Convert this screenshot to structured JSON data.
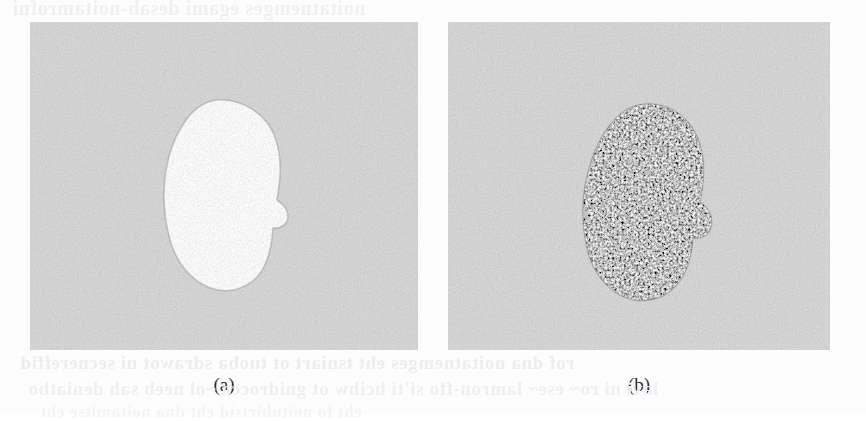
{
  "document": {
    "type": "scanned-journal-page-figure",
    "background_color": "#fdfdfd"
  },
  "bleed_through_text": {
    "top_line": "noitatnemges egami desab-noitamrofni",
    "bottom_line_1": "rof dna noitatnemges eht tsniart ot tuoba sdrawot ni secnereffid",
    "bottom_line_2": "lavi ni ro~ ese~ lamron-ffo si'ti hcihw ot gnidrocca ~ol neeb sah deniatbo",
    "bottom_line_3": "eht fo noitubirtsid eht dna noitamitse eht"
  },
  "figure": {
    "panels": [
      {
        "id": "panel-a",
        "caption": "(a)",
        "description": "noisy grayscale image with a bright pear-shaped blob on speckled gray background",
        "background_gray": "#a9a9a9",
        "blob_tone": "bright",
        "blob_fill": "#e8e8e8",
        "noise_intensity_pct": 18,
        "blob_center": {
          "x": 215,
          "y": 185
        },
        "blob_size": {
          "width": 108,
          "height": 168
        }
      },
      {
        "id": "panel-b",
        "caption": "(b)",
        "description": "noisy grayscale image with a dark high-contrast speckled blob on speckled gray background",
        "background_gray": "#a9a9a9",
        "blob_tone": "dark",
        "blob_fill": "#4a4a4a",
        "noise_intensity_pct": 40,
        "blob_center": {
          "x": 642,
          "y": 192
        },
        "blob_size": {
          "width": 100,
          "height": 176
        }
      }
    ]
  },
  "captions": {
    "a": "(a)",
    "b": "(b)"
  },
  "colors": {
    "page": "#fdfdfd",
    "panel_background": "#a9a9a9",
    "bright_blob": "#e8e8e8",
    "dark_blob": "#4a4a4a",
    "caption_text": "#2b2b2b",
    "bleed_text": "#ededed"
  }
}
